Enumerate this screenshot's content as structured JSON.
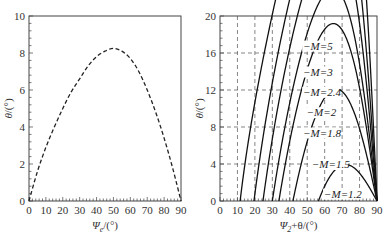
{
  "chart_data": [
    {
      "type": "line",
      "panel": "left",
      "title": "",
      "xlabel": "Ψ_e/(°)",
      "ylabel": "θ/(°)",
      "xlim": [
        0,
        90
      ],
      "ylim": [
        0,
        10
      ],
      "xticks": [
        0,
        10,
        20,
        30,
        40,
        50,
        60,
        70,
        80,
        90
      ],
      "yticks": [
        0,
        2,
        4,
        6,
        8,
        10
      ],
      "grid": false,
      "line_style": "dashed",
      "series": [
        {
          "name": "θ",
          "x": [
            0,
            5,
            10,
            15,
            20,
            25,
            30,
            35,
            40,
            45,
            50,
            55,
            60,
            65,
            70,
            75,
            80,
            85,
            90
          ],
          "y": [
            0,
            1.6,
            2.9,
            4.0,
            5.0,
            5.9,
            6.6,
            7.3,
            7.8,
            8.1,
            8.25,
            8.1,
            7.7,
            7.0,
            6.0,
            4.8,
            3.4,
            1.8,
            0
          ]
        }
      ]
    },
    {
      "type": "line",
      "panel": "right",
      "title": "",
      "xlabel": "Ψ_2+θ/(°)",
      "ylabel": "θ/(°)",
      "xlim": [
        0,
        90
      ],
      "ylim": [
        0,
        20
      ],
      "xticks": [
        0,
        10,
        20,
        30,
        40,
        50,
        60,
        70,
        80,
        90
      ],
      "yticks": [
        0,
        4,
        8,
        12,
        16,
        20
      ],
      "grid": true,
      "line_style": "solid",
      "series": [
        {
          "name": "M=5",
          "label": "−M=5",
          "mach": 5
        },
        {
          "name": "M=3",
          "label": "−M=3",
          "mach": 3
        },
        {
          "name": "M=2.4",
          "label": "−M=2.4",
          "mach": 2.4
        },
        {
          "name": "M=2",
          "label": "−M=2",
          "mach": 2
        },
        {
          "name": "M=1.8",
          "label": "−M=1.8",
          "mach": 1.8
        },
        {
          "name": "M=1.5",
          "label": "−M=1.5",
          "mach": 1.5
        },
        {
          "name": "M=1.2",
          "label": "−M=1.2",
          "mach": 1.2
        }
      ],
      "annotations": [
        {
          "text": "−M=5",
          "x": 58,
          "y": 16.8
        },
        {
          "text": "−M=3",
          "x": 58,
          "y": 14.0
        },
        {
          "text": "−M=2.4",
          "x": 58,
          "y": 11.8
        },
        {
          "text": "−M=2",
          "x": 60,
          "y": 9.6
        },
        {
          "text": "−M=1.8",
          "x": 58,
          "y": 7.4
        },
        {
          "text": "−M=1.5",
          "x": 63,
          "y": 4.0
        },
        {
          "text": "−M=1.2",
          "x": 70,
          "y": 0.8
        }
      ]
    }
  ]
}
